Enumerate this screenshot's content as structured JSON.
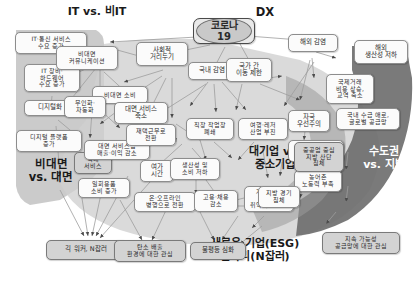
{
  "diagram": {
    "title_top_left": "IT vs. 비IT",
    "title_dx": "DX",
    "root_node": "코로나19",
    "group_labels": [
      {
        "id": "g-it",
        "text": "IT vs. 비IT"
      },
      {
        "id": "g-untact",
        "text": "비대면\nvs. 대면"
      },
      {
        "id": "g-firm",
        "text": "대기업 vs.\n중소기업"
      },
      {
        "id": "g-region",
        "text": "수도권\nvs. 지방"
      },
      {
        "id": "g-dx",
        "text": "DX"
      }
    ],
    "nodes": [
      {
        "id": "n-corona",
        "label": "코로나19"
      },
      {
        "id": "n-it-telecom",
        "label": "IT·통신 서비스\n수요 증가"
      },
      {
        "id": "n-it-hardware",
        "label": "IT 장비·\n하드웨어\n수요 증가"
      },
      {
        "id": "n-digitalize",
        "label": "디지털화"
      },
      {
        "id": "n-digital-plat",
        "label": "디지털 플랫폼\n증가"
      },
      {
        "id": "n-untact-comm",
        "label": "비대면\n커뮤니케이션"
      },
      {
        "id": "n-untact-consume",
        "label": "비대면 소비"
      },
      {
        "id": "n-unmanned",
        "label": "무인화·\n자동화"
      },
      {
        "id": "n-delivery",
        "label": "택배\n서비스"
      },
      {
        "id": "n-disposable",
        "label": "일회용품\n소비 증가"
      },
      {
        "id": "n-social-dist",
        "label": "사회적\n거리두기"
      },
      {
        "id": "n-face-service",
        "label": "대면 서비스\n축소"
      },
      {
        "id": "n-face-biz",
        "label": "대면 서비스업\n매출·이익 감소"
      },
      {
        "id": "n-remote-work",
        "label": "재택근무로\n전환"
      },
      {
        "id": "n-leisure-time",
        "label": "여가\n시간"
      },
      {
        "id": "n-on-offline",
        "label": "온·오프라인\n병행으로 전환"
      },
      {
        "id": "n-domestic-inf",
        "label": "국내 감염"
      },
      {
        "id": "n-workplace",
        "label": "직장 작업장\n폐쇄"
      },
      {
        "id": "n-productivity",
        "label": "생산성 및\n소비 저하"
      },
      {
        "id": "n-recession",
        "label": "경기 침체"
      },
      {
        "id": "n-hiring-down",
        "label": "고용·채용\n감소"
      },
      {
        "id": "n-vulnerable",
        "label": "계약직 및\n여성 등\n취약계층 실업"
      },
      {
        "id": "n-travel",
        "label": "여행·레저\n산업 부진"
      },
      {
        "id": "n-cross-border",
        "label": "국가 간\n이동 제한"
      },
      {
        "id": "n-overseas-inf",
        "label": "해외 감염"
      },
      {
        "id": "n-overseas-prod",
        "label": "해외\n생산성 저하"
      },
      {
        "id": "n-trade-cost",
        "label": "국제거래\n비용 상승,\n교역 축소"
      },
      {
        "id": "n-nationalism",
        "label": "자국\n우선주의"
      },
      {
        "id": "n-supply-chain",
        "label": "국내 수급 애로,\n글로벌 공급망"
      },
      {
        "id": "n-foreign-labor",
        "label": "외국인 근로자\n입국 축소"
      },
      {
        "id": "n-rural-labor",
        "label": "농어촌\n노동력 부족"
      },
      {
        "id": "n-heavy-ind",
        "label": "중공업 중심\n지방 산단\n침체"
      },
      {
        "id": "n-local-econ",
        "label": "지방 경기\n침체"
      },
      {
        "id": "n-gig-worker",
        "label": "긱 워커, N잡러"
      },
      {
        "id": "n-carbon",
        "label": "탄소 배출\n환경에 대한 관심"
      },
      {
        "id": "n-inequality",
        "label": "불평등 심화"
      },
      {
        "id": "n-sustain",
        "label": "지속 가능성\n공급망에 대한 관심"
      }
    ],
    "outcome_labels": [
      {
        "id": "o-esg",
        "text": "새로운 기업(ESG)\n일자리(N잡러)"
      }
    ],
    "colors": {
      "node_fill": "#fbfbfb",
      "node_fill_shaded": "#d3d3d3",
      "node_border": "#8d8d8d",
      "root_fill": "#e9e9e9",
      "root_inner_fill": "#c9c9c9",
      "edge": "#9a9a9a",
      "region_light": "#c8c8c8",
      "region_dark": "#6f6f6f",
      "background": "#ffffff",
      "text": "#2a2a2a"
    }
  }
}
